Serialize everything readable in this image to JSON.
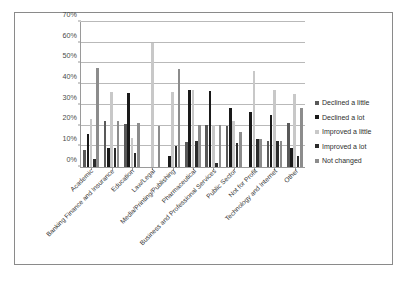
{
  "chart_data": {
    "type": "bar",
    "title": "",
    "subtitle": "",
    "xlabel": "",
    "ylabel": "",
    "ylim": [
      0,
      70
    ],
    "ytick_step": 10,
    "ytick_labels": [
      "0%",
      "10%",
      "20%",
      "30%",
      "40%",
      "50%",
      "60%",
      "70%"
    ],
    "grid": true,
    "legend_position": "right",
    "categories": [
      "Academic",
      "Banking Finance and Insurance",
      "Education",
      "Law/Legal",
      "Media/Printing/Publishing",
      "Pharmaceutical",
      "Business and Professional Services",
      "Public Sector",
      "Not for Profit",
      "Technology and Internet",
      "Other"
    ],
    "series": [
      {
        "name": "Declined a little",
        "color": "#595959",
        "values": [
          8.0,
          22.3,
          21.0,
          0.0,
          0.0,
          12.3,
          20.2,
          20.0,
          0.0,
          12.5,
          21.3
        ]
      },
      {
        "name": "Declined a lot",
        "color": "#1a1a1a",
        "values": [
          15.7,
          9.0,
          35.5,
          0.0,
          5.2,
          37.2,
          36.5,
          28.5,
          26.5,
          25.0,
          9.1
        ]
      },
      {
        "name": "Improved a little",
        "color": "#c8c8c8",
        "values": [
          23.4,
          36.0,
          14.2,
          60.0,
          36.4,
          37.0,
          20.3,
          22.4,
          46.5,
          37.4,
          35.4
        ]
      },
      {
        "name": "Improved a lot",
        "color": "#2b2b2b",
        "values": [
          4.0,
          9.0,
          7.0,
          0.0,
          10.3,
          12.4,
          2.0,
          11.4,
          13.3,
          12.5,
          5.4
        ]
      },
      {
        "name": "Not changed",
        "color": "#8c8c8c",
        "values": [
          47.6,
          22.4,
          21.1,
          20.0,
          47.2,
          20.4,
          20.3,
          17.0,
          13.3,
          12.5,
          28.4
        ]
      }
    ]
  }
}
